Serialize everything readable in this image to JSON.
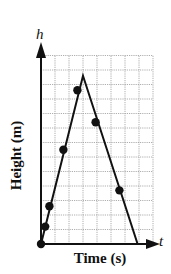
{
  "chart_data": {
    "type": "line",
    "title": "",
    "xlabel": "Time (s)",
    "ylabel": "Height (m)",
    "x_axis_symbol": "t",
    "y_axis_symbol": "h",
    "grid": true,
    "grid_columns": 8,
    "grid_rows": 13,
    "xlim": [
      0,
      8
    ],
    "ylim": [
      0,
      13
    ],
    "tick_labels": "none",
    "legend": "none",
    "series": [
      {
        "name": "trajectory-line",
        "style": "solid line, straight segments",
        "points": [
          [
            0,
            0
          ],
          [
            3.0,
            11.6
          ],
          [
            6.9,
            0
          ]
        ]
      },
      {
        "name": "data-points",
        "style": "filled circles",
        "points": [
          [
            0,
            0
          ],
          [
            0.3,
            1.2
          ],
          [
            0.6,
            2.6
          ],
          [
            1.6,
            6.5
          ],
          [
            2.6,
            10.6
          ],
          [
            3.9,
            8.4
          ],
          [
            5.6,
            3.7
          ]
        ]
      }
    ],
    "colors": {
      "line": "#111111",
      "grid": "#9a9a9a",
      "background": "#ffffff"
    }
  },
  "labels": {
    "xlabel": "Time (s)",
    "ylabel": "Height (m)",
    "x_symbol": "t",
    "y_symbol": "h"
  }
}
